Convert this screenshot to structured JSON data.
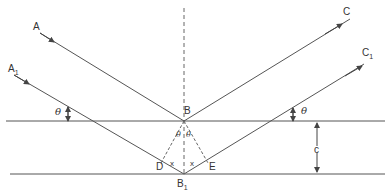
{
  "diagram": {
    "type": "bragg-reflection-geometry",
    "labels": {
      "A": "A",
      "A1_main": "A",
      "A1_sub": "1",
      "C": "C",
      "C1_main": "C",
      "C1_sub": "1",
      "B": "B",
      "B1_main": "B",
      "B1_sub": "1",
      "D": "D",
      "E": "E",
      "x_left": "x",
      "x_right": "x",
      "theta_left_angle": "θ",
      "theta_right_angle": "θ",
      "theta_inner_left": "θ",
      "theta_inner_right": "θ",
      "spacing": "c"
    },
    "colors": {
      "line": "#555555",
      "text": "#333333",
      "background": "#ffffff"
    }
  }
}
